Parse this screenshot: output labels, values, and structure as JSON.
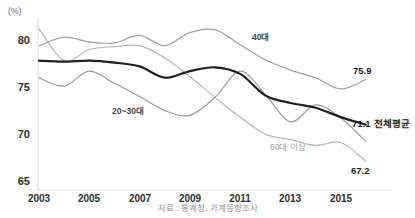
{
  "chart_data": {
    "type": "line",
    "unit_label": "(%)",
    "x": [
      2003,
      2004,
      2005,
      2006,
      2007,
      2008,
      2009,
      2010,
      2011,
      2012,
      2013,
      2014,
      2015,
      2016
    ],
    "x_tick_labels": [
      "2003",
      "2005",
      "2007",
      "2009",
      "2011",
      "2013",
      "2015"
    ],
    "y_tick_labels": [
      "80",
      "75",
      "70",
      "65"
    ],
    "y_ticks": [
      80,
      75,
      70,
      65
    ],
    "ylim": [
      64.1,
      82.3
    ],
    "grid": false,
    "legend": "inline-annotations",
    "series": [
      {
        "name": "60대 이상",
        "color": "#b5b5b5",
        "width": 1.2,
        "values": [
          81.3,
          77.9,
          79.1,
          79.4,
          79.5,
          78.2,
          76.2,
          74.0,
          71.9,
          70.1,
          69.5,
          68.9,
          69.2,
          67.2
        ]
      },
      {
        "name": "40대",
        "color": "#9c9c9c",
        "width": 1.2,
        "values": [
          79.5,
          80.4,
          79.9,
          79.8,
          80.6,
          79.5,
          80.9,
          81.2,
          79.6,
          78.0,
          76.9,
          76.1,
          74.9,
          75.9
        ]
      },
      {
        "name": "20~30대",
        "color": "#999999",
        "width": 1.2,
        "values": [
          76.1,
          75.2,
          76.8,
          75.5,
          74.1,
          72.6,
          72.1,
          74.0,
          76.8,
          74.3,
          71.4,
          73.2,
          71.8,
          69.3
        ]
      },
      {
        "name": "전체평균",
        "color": "#1f1f1f",
        "width": 2.2,
        "values": [
          77.9,
          77.8,
          77.9,
          77.7,
          77.3,
          76.1,
          76.8,
          77.2,
          76.5,
          74.2,
          73.4,
          72.9,
          71.9,
          71.1
        ]
      }
    ],
    "end_labels": {
      "s40": "75.9",
      "avg": "71.1",
      "s60": "67.2"
    },
    "source": "자료 : 통계청, 가계동향조사",
    "axis_color": "#d9d9d9"
  }
}
